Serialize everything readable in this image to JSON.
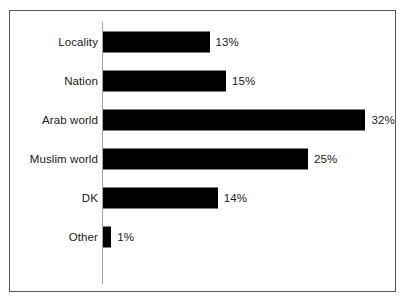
{
  "figure": {
    "frame_border_color": "#595959",
    "background_color": "#ffffff",
    "axis_line_color": "#a6a6a6",
    "bar_color": "#000000"
  },
  "chart_data": {
    "type": "bar",
    "orientation": "horizontal",
    "title": "",
    "subtitle": "",
    "xlabel": "",
    "ylabel": "",
    "grid": false,
    "legend": null,
    "legend_position": "none",
    "xlim": [
      0,
      32
    ],
    "categories": [
      "Locality",
      "Nation",
      "Arab world",
      "Muslim world",
      "DK",
      "Other"
    ],
    "values": [
      13,
      15,
      32,
      25,
      14,
      1
    ],
    "value_labels": [
      "13%",
      "15%",
      "32%",
      "25%",
      "14%",
      "1%"
    ],
    "units": "percent",
    "bars": [
      {
        "category": "Locality",
        "value": 13,
        "label": "13%"
      },
      {
        "category": "Nation",
        "value": 15,
        "label": "15%"
      },
      {
        "category": "Arab world",
        "value": 32,
        "label": "32%"
      },
      {
        "category": "Muslim world",
        "value": 25,
        "label": "25%"
      },
      {
        "category": "DK",
        "value": 14,
        "label": "14%"
      },
      {
        "category": "Other",
        "value": 1,
        "label": "1%"
      }
    ]
  }
}
